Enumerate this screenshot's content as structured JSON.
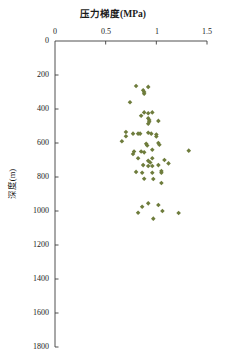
{
  "chart_data": {
    "type": "scatter",
    "title": "",
    "xlabel": "压力梯度(MPa)",
    "ylabel": "深度(m)",
    "xlabel_position": "top",
    "xlim": [
      0,
      1.5
    ],
    "ylim": [
      0,
      1800
    ],
    "y_inverted": true,
    "grid": false,
    "legend": null,
    "xticks": [
      "0",
      "0.5",
      "1",
      "1.5"
    ],
    "xtick_values": [
      0,
      0.5,
      1,
      1.5
    ],
    "yticks": [
      "0",
      "200",
      "400",
      "600",
      "800",
      "1000",
      "1200",
      "1400",
      "1600",
      "1800"
    ],
    "ytick_values": [
      0,
      200,
      400,
      600,
      800,
      1000,
      1200,
      1400,
      1600,
      1800
    ],
    "marker": "diamond",
    "marker_color": "#6E7C3C",
    "marker_size": 4.6,
    "series": [
      {
        "name": "压力梯度",
        "points": [
          [
            0.8,
            265
          ],
          [
            0.92,
            270
          ],
          [
            0.87,
            290
          ],
          [
            0.88,
            300
          ],
          [
            0.88,
            310
          ],
          [
            0.74,
            360
          ],
          [
            0.88,
            420
          ],
          [
            0.92,
            425
          ],
          [
            0.96,
            420
          ],
          [
            0.85,
            440
          ],
          [
            0.92,
            455
          ],
          [
            0.93,
            465
          ],
          [
            0.93,
            475
          ],
          [
            0.92,
            487
          ],
          [
            1.02,
            470
          ],
          [
            0.7,
            535
          ],
          [
            0.7,
            560
          ],
          [
            0.77,
            545
          ],
          [
            0.82,
            545
          ],
          [
            0.84,
            545
          ],
          [
            0.92,
            540
          ],
          [
            0.95,
            545
          ],
          [
            1.0,
            550
          ],
          [
            1.0,
            562
          ],
          [
            0.66,
            590
          ],
          [
            0.9,
            605
          ],
          [
            0.91,
            615
          ],
          [
            1.02,
            600
          ],
          [
            1.03,
            610
          ],
          [
            0.96,
            640
          ],
          [
            1.32,
            645
          ],
          [
            0.85,
            650
          ],
          [
            0.88,
            655
          ],
          [
            0.78,
            650
          ],
          [
            0.77,
            665
          ],
          [
            0.82,
            690
          ],
          [
            0.96,
            690
          ],
          [
            0.92,
            705
          ],
          [
            0.94,
            715
          ],
          [
            1.08,
            700
          ],
          [
            0.87,
            730
          ],
          [
            0.92,
            735
          ],
          [
            0.96,
            735
          ],
          [
            1.02,
            730
          ],
          [
            1.12,
            720
          ],
          [
            0.8,
            770
          ],
          [
            0.86,
            775
          ],
          [
            0.96,
            775
          ],
          [
            1.05,
            765
          ],
          [
            1.05,
            775
          ],
          [
            0.88,
            810
          ],
          [
            0.97,
            812
          ],
          [
            1.05,
            835
          ],
          [
            0.92,
            955
          ],
          [
            0.86,
            975
          ],
          [
            1.02,
            965
          ],
          [
            1.06,
            1000
          ],
          [
            0.82,
            1010
          ],
          [
            1.22,
            1012
          ],
          [
            0.97,
            1045
          ]
        ]
      }
    ],
    "note_points_count": 60
  },
  "axes": {
    "plot_left_px": 55,
    "plot_right_px": 207,
    "plot_top_px": 41,
    "plot_bottom_px": 347
  }
}
